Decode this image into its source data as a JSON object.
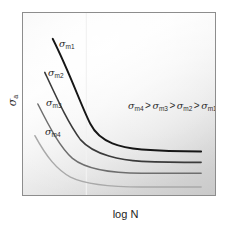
{
  "chart_data": {
    "type": "line",
    "title": "",
    "xlabel": "log N",
    "ylabel": "σa",
    "grid": false,
    "legend_position": "inline-labels",
    "annotation": "σm4 > σm3 > σm2 > σm1",
    "axis_note": "Schematic S-N (fatigue) curves: alternating stress amplitude versus log of cycles to failure, for four mean-stress levels.",
    "xlim": [
      0,
      1
    ],
    "ylim": [
      0,
      1
    ],
    "series": [
      {
        "name": "σm1",
        "label_sym": "σ",
        "label_sub": "m1",
        "color": "#161616",
        "width": 1.9,
        "label_x": 36,
        "label_y": 26,
        "path": "M 30,26 C 48,62 58,92 68,112 C 78,132 100,136 120,138 C 145,140 165,140 180,140",
        "start": [
          30,
          26
        ],
        "end": [
          180,
          140
        ],
        "asymptote": 140
      },
      {
        "name": "σm2",
        "label_sym": "σ",
        "label_sub": "m2",
        "color": "#3b3b3b",
        "width": 1.6,
        "label_x": 25,
        "label_y": 55,
        "path": "M 22,60 C 36,90 46,112 58,128 C 72,144 100,149 120,150 C 145,151 165,151 180,151",
        "start": [
          22,
          60
        ],
        "end": [
          180,
          151
        ],
        "asymptote": 151
      },
      {
        "name": "σm3",
        "label_sym": "σ",
        "label_sub": "m3",
        "color": "#6e6e6e",
        "width": 1.5,
        "label_x": 23,
        "label_y": 85,
        "path": "M 15,92 C 28,118 38,136 50,147 C 66,160 100,162 120,162 C 145,162 165,162 180,162",
        "start": [
          15,
          92
        ],
        "end": [
          180,
          162
        ],
        "asymptote": 162
      },
      {
        "name": "σm4",
        "label_sym": "σ",
        "label_sub": "m4",
        "color": "#a9a9a9",
        "width": 1.5,
        "label_x": 22,
        "label_y": 114,
        "path": "M 12,124 C 24,146 34,158 48,166 C 66,175 100,176 120,176 C 145,176 165,176 180,176",
        "start": [
          12,
          124
        ],
        "end": [
          180,
          176
        ],
        "asymptote": 176
      }
    ],
    "marker_line": {
      "name": "vertical-guide",
      "x": 64,
      "color": "#f2f2f2"
    }
  },
  "frame": {
    "border_color": "#8d8d8d"
  },
  "inequality": {
    "sym": "σ",
    "s1": "m4",
    "s2": "m3",
    "s3": "m2",
    "s4": "m1",
    "gt": ">"
  },
  "axes": {
    "x_label": "log N",
    "y_sym": "σ",
    "y_sub": "a"
  }
}
